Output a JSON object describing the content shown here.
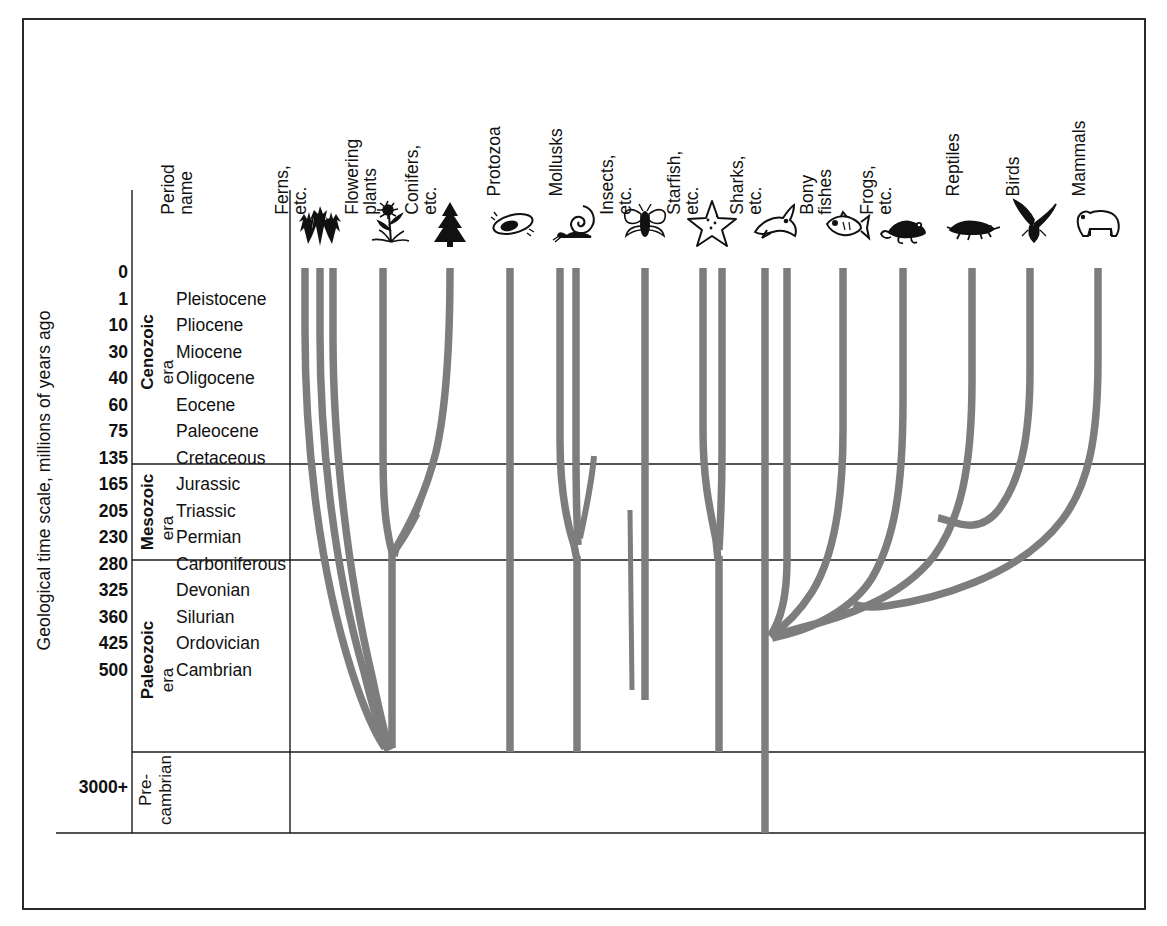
{
  "figure": {
    "axis_title": "Geological time scale, millions of years ago",
    "period_header": [
      "Period",
      "name"
    ]
  },
  "style": {
    "branch_color": "#7d7d7d",
    "rule_color": "#1a1a1a",
    "frame_color": "#2a2a2a"
  },
  "chart_data": {
    "type": "diagram",
    "title": "Geological time scale, millions of years ago",
    "subtype": "phylogenetic-range-chart",
    "ylabel": "Geological time scale, millions of years ago",
    "y_axis_direction": "present at top, oldest at bottom",
    "eras": [
      {
        "name": "Cenozoic",
        "suffix": "era",
        "periods": [
          {
            "age": "0",
            "name": ""
          },
          {
            "age": "1",
            "name": "Pleistocene"
          },
          {
            "age": "10",
            "name": "Pliocene"
          },
          {
            "age": "30",
            "name": "Miocene"
          },
          {
            "age": "40",
            "name": "Oligocene"
          },
          {
            "age": "60",
            "name": "Eocene"
          },
          {
            "age": "75",
            "name": "Paleocene"
          }
        ]
      },
      {
        "name": "Mesozoic",
        "suffix": "era",
        "periods": [
          {
            "age": "135",
            "name": "Cretaceous"
          },
          {
            "age": "165",
            "name": "Jurassic"
          },
          {
            "age": "205",
            "name": "Triassic"
          }
        ]
      },
      {
        "name": "Paleozoic",
        "suffix": "era",
        "periods": [
          {
            "age": "230",
            "name": "Permian"
          },
          {
            "age": "280",
            "name": "Carboniferous"
          },
          {
            "age": "325",
            "name": "Devonian"
          },
          {
            "age": "360",
            "name": "Silurian"
          },
          {
            "age": "425",
            "name": "Ordovician"
          },
          {
            "age": "500",
            "name": "Cambrian"
          }
        ]
      },
      {
        "name": "Pre-cambrian",
        "name_line1": "Pre-",
        "name_line2": "cambrian",
        "suffix": "",
        "periods": [
          {
            "age": "3000+",
            "name": ""
          }
        ]
      }
    ],
    "groups": [
      {
        "label_line1": "Ferns,",
        "label_line2": "etc.",
        "icon": "fern-icon",
        "origin_age": "3000+",
        "extant": true
      },
      {
        "label_line1": "Flowering",
        "label_line2": "plants",
        "icon": "flower-icon",
        "origin_age": "165",
        "extant": true
      },
      {
        "label_line1": "Conifers,",
        "label_line2": "etc.",
        "icon": "conifer-icon",
        "origin_age": "205",
        "extant": true
      },
      {
        "label_line1": "Protozoa",
        "label_line2": "",
        "icon": "protozoa-icon",
        "origin_age": "3000+",
        "extant": true
      },
      {
        "label_line1": "Mollusks",
        "label_line2": "",
        "icon": "mollusk-icon",
        "origin_age": "3000+",
        "extant": true
      },
      {
        "label_line1": "Insects,",
        "label_line2": "etc.",
        "icon": "insect-icon",
        "origin_age": "500",
        "extant": true
      },
      {
        "label_line1": "Starfish,",
        "label_line2": "etc.",
        "icon": "starfish-icon",
        "origin_age": "3000+",
        "extant": true
      },
      {
        "label_line1": "Sharks,",
        "label_line2": "etc.",
        "icon": "shark-icon",
        "origin_age": "3000+",
        "extant": true
      },
      {
        "label_line1": "Bony",
        "label_line2": "fishes",
        "icon": "bonyfish-icon",
        "origin_age": "360",
        "extant": true
      },
      {
        "label_line1": "Frogs,",
        "label_line2": "etc.",
        "icon": "frog-icon",
        "origin_age": "325",
        "extant": true
      },
      {
        "label_line1": "Reptiles",
        "label_line2": "",
        "icon": "reptile-icon",
        "origin_age": "280",
        "extant": true
      },
      {
        "label_line1": "Birds",
        "label_line2": "",
        "icon": "bird-icon",
        "origin_age": "205",
        "extant": true
      },
      {
        "label_line1": "Mammals",
        "label_line2": "",
        "icon": "mammal-icon",
        "origin_age": "205",
        "extant": true
      }
    ]
  }
}
